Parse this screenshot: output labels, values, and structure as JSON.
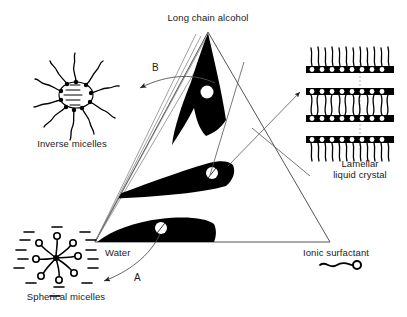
{
  "diagram": {
    "type": "ternary-phase-diagram"
  },
  "vertices": {
    "top": "Long chain alcohol",
    "bottom_left": "Water",
    "bottom_right": "Ionic surfactant"
  },
  "structures": [
    {
      "id": "inverse-micelles",
      "label": "Inverse micelles"
    },
    {
      "id": "spherical-micelles",
      "label": "Spherical micelles"
    },
    {
      "id": "lamellar",
      "label_line1": "Lamellar",
      "label_line2": "liquid crystal"
    }
  ],
  "legend": {
    "symbol_label": "Ionic surfactant",
    "symbol_name": "surfactant-molecule-glyph"
  },
  "arrows": [
    {
      "id": "arrow-B",
      "label": "B",
      "from": "upper-phase-region",
      "to": "inverse-micelles"
    },
    {
      "id": "arrow-A",
      "label": "A",
      "from": "lower-phase-region",
      "to": "spherical-micelles"
    },
    {
      "id": "arrow-lamellar",
      "label": "",
      "from": "middle-phase-region",
      "to": "lamellar"
    }
  ],
  "phase_regions": [
    {
      "id": "upper-phase-region",
      "fill": "#000000",
      "marker": "white-dot"
    },
    {
      "id": "middle-phase-region",
      "fill": "#000000",
      "marker": "white-dot"
    },
    {
      "id": "lower-phase-region",
      "fill": "#000000",
      "marker": "white-dot"
    }
  ],
  "colors": {
    "ink": "#111111",
    "fill": "#000000",
    "paper": "#ffffff",
    "line": "#444444"
  }
}
